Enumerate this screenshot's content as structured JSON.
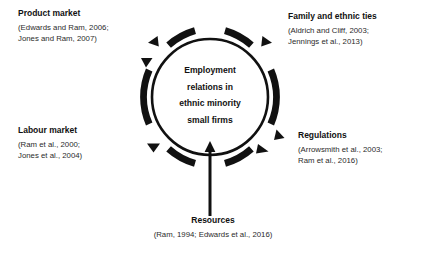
{
  "diagram": {
    "center": {
      "lines": [
        "Employment",
        "relations in",
        "ethnic minority",
        "small firms"
      ]
    },
    "factors": [
      {
        "id": "product-market",
        "heading": "Product market",
        "citations": [
          "(Edwards and Ram, 2006;",
          "Jones and Ram, 2007)"
        ]
      },
      {
        "id": "family-ties",
        "heading": "Family and ethnic ties",
        "citations": [
          "(Aldrich and Cliff, 2003;",
          "Jennings et al., 2013)"
        ]
      },
      {
        "id": "labour-market",
        "heading": "Labour market",
        "citations": [
          "(Ram et al., 2000;",
          "Jones et al., 2004)"
        ]
      },
      {
        "id": "regulations",
        "heading": "Regulations",
        "citations": [
          "(Arrowsmith et al., 2003;",
          "Ram et al., 2016)"
        ]
      },
      {
        "id": "resources",
        "heading": "Resources",
        "citations": [
          "(Ram, 1994; Edwards et al., 2016)"
        ]
      }
    ],
    "icons": {
      "inner_circle": "circle-outline-icon",
      "outer_ring": "dashed-ring-icon",
      "outward_arrowheads": "triangle-arrowhead-icon",
      "resource_arrow": "up-arrow-icon"
    },
    "colors": {
      "stroke": "#111111",
      "text": "#1a1a1a",
      "background": "#ffffff"
    }
  }
}
